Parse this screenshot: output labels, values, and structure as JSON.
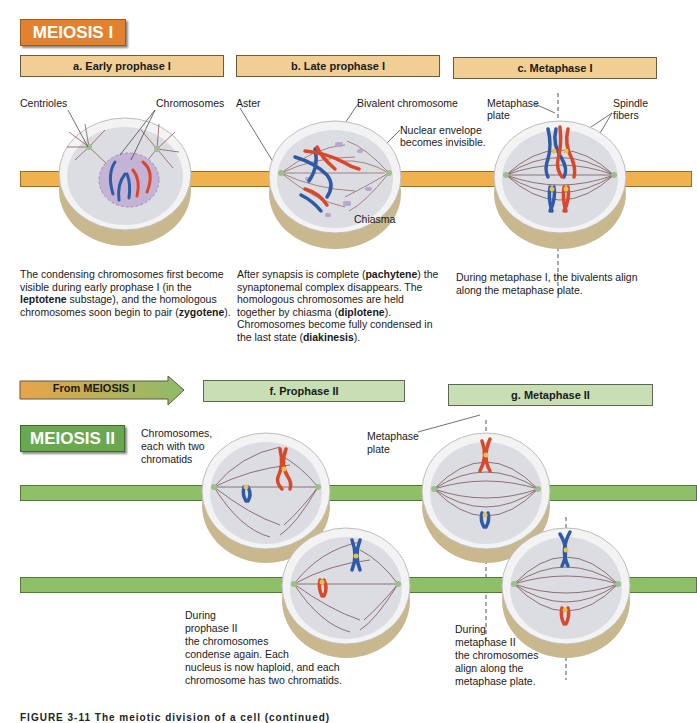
{
  "meiosis1": {
    "badge": "MEIOSIS I",
    "phases": [
      {
        "id": "a",
        "title": "a.  Early prophase I",
        "labels": [
          "Centrioles",
          "Chromosomes"
        ],
        "description_parts": [
          {
            "text": "The condensing chromosomes first become visible during early prophase I (in the ",
            "bold": false
          },
          {
            "text": "leptotene",
            "bold": true
          },
          {
            "text": " substage), and the homologous chromosomes soon begin to pair (",
            "bold": false
          },
          {
            "text": "zygotene",
            "bold": true
          },
          {
            "text": ").",
            "bold": false
          }
        ]
      },
      {
        "id": "b",
        "title": "b.  Late prophase I",
        "labels": [
          "Aster",
          "Bivalent chromosome",
          "Nuclear envelope becomes invisible.",
          "Chiasma"
        ],
        "description_parts": [
          {
            "text": "After synapsis is complete (",
            "bold": false
          },
          {
            "text": "pachytene",
            "bold": true
          },
          {
            "text": ") the synaptonemal complex disappears. The homologous chromosomes are held together by chiasma (",
            "bold": false
          },
          {
            "text": "diplotene",
            "bold": true
          },
          {
            "text": "). Chromosomes become fully condensed in the last state (",
            "bold": false
          },
          {
            "text": "diakinesis",
            "bold": true
          },
          {
            "text": ").",
            "bold": false
          }
        ]
      },
      {
        "id": "c",
        "title": "c.  Metaphase I",
        "labels": [
          "Metaphase plate",
          "Spindle fibers"
        ],
        "description_parts": [
          {
            "text": "During metaphase I, the bivalents align along the metaphase plate.",
            "bold": false
          }
        ]
      }
    ]
  },
  "meiosis2": {
    "badge": "MEIOSIS II",
    "from_arrow": "From MEIOSIS I",
    "phases": [
      {
        "id": "f",
        "title": "f.  Prophase II",
        "labels": [
          "Chromosomes, each with two chromatids"
        ],
        "description": "During prophase II the chromosomes condense again. Each nucleus is now haploid, and each chromosome has two chromatids."
      },
      {
        "id": "g",
        "title": "g.  Metaphase II",
        "labels": [
          "Metaphase plate"
        ],
        "description": "During metaphase II the chromosomes align along the metaphase plate."
      }
    ]
  },
  "text": {
    "a_lbl_centrioles": "Centrioles",
    "a_lbl_chromosomes": "Chromosomes",
    "b_lbl_aster": "Aster",
    "b_lbl_bivalent": "Bivalent chromosome",
    "b_lbl_nuclear1": "Nuclear envelope",
    "b_lbl_nuclear2": "becomes invisible.",
    "b_lbl_chiasma": "Chiasma",
    "c_lbl_meta1": "Metaphase",
    "c_lbl_meta2": "plate",
    "c_lbl_spindle1": "Spindle",
    "c_lbl_spindle2": "fibers",
    "f_lbl_1": "Chromosomes,",
    "f_lbl_2": "each with two",
    "f_lbl_3": "chromatids",
    "g_lbl_1": "Metaphase",
    "g_lbl_2": "plate",
    "f_desc_lines": [
      "During",
      "prophase II",
      "the chromosomes",
      "condense again. Each",
      "nucleus is now haploid, and each",
      "chromosome has two chromatids."
    ],
    "g_desc_lines": [
      "During",
      "metaphase II",
      "the chromosomes",
      "align along the",
      "metaphase plate."
    ]
  },
  "caption": "FIGURE 3-11  The meiotic division of a cell (continued)",
  "colors": {
    "meiosis1_accent": "#e2822e",
    "meiosis1_bar": "#efb24f",
    "meiosis1_header": "#f1cf94",
    "meiosis2_accent": "#6aa84f",
    "meiosis2_bar": "#8fc068",
    "meiosis2_header": "#c8deb4",
    "chromosome_maternal": "#d9482b",
    "chromosome_paternal": "#2f5aa8"
  }
}
